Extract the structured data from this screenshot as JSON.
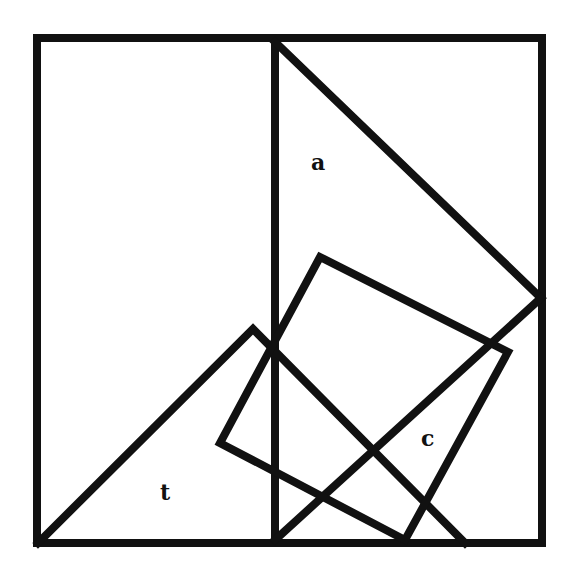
{
  "diagram": {
    "title": "",
    "stroke_color": "#111111",
    "background": "#ffffff",
    "stroke_width": 8,
    "labels": [
      {
        "id": "a",
        "text": "a",
        "x": 318,
        "y": 170
      },
      {
        "id": "t",
        "text": "t",
        "x": 166,
        "y": 500
      },
      {
        "id": "c",
        "text": "c",
        "x": 428,
        "y": 446
      }
    ],
    "shapes": [
      {
        "name": "outer-square",
        "points": [
          [
            37,
            38
          ],
          [
            542,
            38
          ],
          [
            542,
            543
          ],
          [
            37,
            543
          ]
        ]
      },
      {
        "name": "center-divider",
        "points": [
          [
            275,
            38
          ],
          [
            275,
            543
          ]
        ]
      },
      {
        "name": "triangle-a-hypotenuse",
        "points": [
          [
            275,
            42
          ],
          [
            541,
            298
          ]
        ]
      },
      {
        "name": "diagonal-up-right",
        "points": [
          [
            275,
            540
          ],
          [
            541,
            298
          ]
        ]
      },
      {
        "name": "triangle-t",
        "points": [
          [
            38,
            543
          ],
          [
            253,
            329
          ],
          [
            465,
            543
          ]
        ]
      },
      {
        "name": "rotated-square-c",
        "points": [
          [
            320,
            257
          ],
          [
            508,
            352
          ],
          [
            405,
            540
          ],
          [
            220,
            443
          ]
        ]
      }
    ]
  }
}
